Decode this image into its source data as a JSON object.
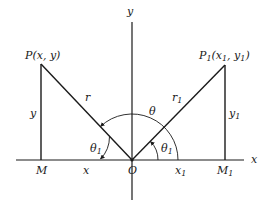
{
  "diagram": {
    "axes": {
      "x_label": "x",
      "y_label": "y",
      "origin_label": "O"
    },
    "points": {
      "P": {
        "label": "P(x, y)",
        "name": "P",
        "coords": "(x, y)"
      },
      "P1": {
        "label_main": "P",
        "label_sub": "1",
        "label_rest": "(x",
        "label_sub2": "1",
        "label_mid": ", y",
        "label_sub3": "1",
        "label_end": ")"
      },
      "M": {
        "label": "M"
      },
      "M1": {
        "label_main": "M",
        "label_sub": "1"
      }
    },
    "segments": {
      "r": "r",
      "r1_main": "r",
      "r1_sub": "1",
      "y": "y",
      "y1_main": "y",
      "y1_sub": "1",
      "x": "x",
      "x1_main": "x",
      "x1_sub": "1"
    },
    "angles": {
      "theta": "θ",
      "theta1_left_main": "θ",
      "theta1_left_sub": "1",
      "theta1_right_main": "θ",
      "theta1_right_sub": "1"
    },
    "colors": {
      "stroke": "#1a1a1a",
      "background": "#ffffff"
    }
  }
}
